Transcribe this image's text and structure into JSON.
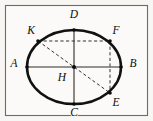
{
  "figure": {
    "kind": "geometry-diagram",
    "caption": "",
    "frame": {
      "stroke_color": "#6e6a64",
      "fill_color": "#fbfaf8"
    },
    "background_color": "#f7f6f3",
    "ink_color": "#111111"
  },
  "chart_data": {
    "type": "scatter",
    "title": "",
    "xlabel": "",
    "ylabel": "",
    "xlim": [
      0,
      153
    ],
    "ylim": [
      0,
      121
    ],
    "grid": false,
    "legend": "none",
    "shapes": [
      {
        "name": "ellipse",
        "kind": "ellipse",
        "cx": 74,
        "cy": 67,
        "rx": 47,
        "ry": 37,
        "style": "solid",
        "stroke_width": 2.5
      },
      {
        "name": "major-axis-AB",
        "kind": "segment",
        "from": "A",
        "to": "B",
        "style": "solid"
      },
      {
        "name": "minor-axis-DC",
        "kind": "segment",
        "from": "D",
        "to": "C",
        "style": "solid"
      },
      {
        "name": "chord-KF",
        "kind": "segment",
        "from": "K",
        "to": "F",
        "style": "dashed"
      },
      {
        "name": "diagonal-KE",
        "kind": "segment",
        "from": "K",
        "to": "E",
        "style": "dashed"
      },
      {
        "name": "chord-FE",
        "kind": "segment",
        "from": "F",
        "to": "E",
        "style": "dashed"
      }
    ],
    "points": [
      {
        "label": "A",
        "x": 27,
        "y": 67,
        "label_x": 14,
        "label_y": 64,
        "marker": "dot"
      },
      {
        "label": "B",
        "x": 121,
        "y": 67,
        "label_x": 133,
        "label_y": 64,
        "marker": "dot"
      },
      {
        "label": "C",
        "x": 74,
        "y": 104,
        "label_x": 74,
        "label_y": 113,
        "marker": "dot"
      },
      {
        "label": "D",
        "x": 74,
        "y": 30,
        "label_x": 74,
        "label_y": 15,
        "marker": "dot"
      },
      {
        "label": "E",
        "x": 110,
        "y": 93,
        "label_x": 116,
        "label_y": 103,
        "marker": "dot"
      },
      {
        "label": "F",
        "x": 110,
        "y": 41,
        "label_x": 116,
        "label_y": 31,
        "marker": "dot"
      },
      {
        "label": "H",
        "x": 74,
        "y": 67,
        "label_x": 62,
        "label_y": 78,
        "marker": "dot"
      },
      {
        "label": "K",
        "x": 38,
        "y": 41,
        "label_x": 31,
        "label_y": 31,
        "marker": "dot"
      }
    ]
  }
}
